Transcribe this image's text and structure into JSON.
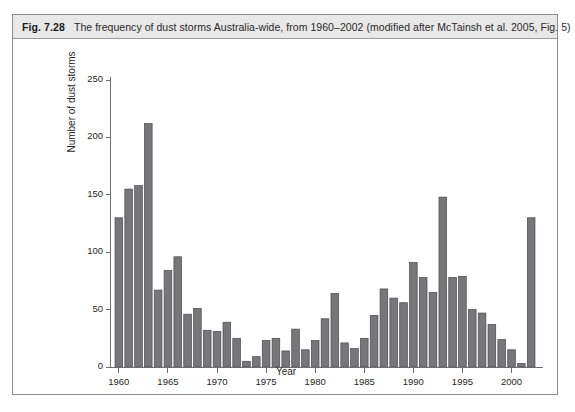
{
  "figure": {
    "number": "Fig. 7.28",
    "caption": "The frequency of dust storms Australia-wide, from 1960–2002 (modified after McTainsh et al. 2005, Fig. 5)"
  },
  "colors": {
    "bar_fill": "#77777a",
    "bar_stroke": "#4a4a4c",
    "axis": "#6e6e6e",
    "frame": "#8d8d8d",
    "caption_band": "#e8e8e8",
    "page_background": "#ffffff",
    "text": "#1f1f1f"
  },
  "chart_data": {
    "type": "bar",
    "title": "",
    "subtitle": "",
    "xlabel": "Year",
    "ylabel": "Number of dust storms",
    "xlim": [
      1959.2,
      2002.8
    ],
    "ylim": [
      0,
      250
    ],
    "yticks": [
      0,
      50,
      100,
      150,
      200,
      250
    ],
    "ytick_labels": [
      "0",
      "50",
      "100",
      "150",
      "200",
      "250"
    ],
    "xticks": [
      1960,
      1965,
      1970,
      1975,
      1980,
      1985,
      1990,
      1995,
      2000
    ],
    "xtick_labels": [
      "1960",
      "1965",
      "1970",
      "1975",
      "1980",
      "1985",
      "1990",
      "1995",
      "2000"
    ],
    "grid": false,
    "legend": false,
    "legend_position": "none",
    "categories": [
      1960,
      1961,
      1962,
      1963,
      1964,
      1965,
      1966,
      1967,
      1968,
      1969,
      1970,
      1971,
      1972,
      1973,
      1974,
      1975,
      1976,
      1977,
      1978,
      1979,
      1980,
      1981,
      1982,
      1983,
      1984,
      1985,
      1986,
      1987,
      1988,
      1989,
      1990,
      1991,
      1992,
      1993,
      1994,
      1995,
      1996,
      1997,
      1998,
      1999,
      2000,
      2001,
      2002
    ],
    "values": [
      130,
      155,
      158,
      212,
      67,
      84,
      96,
      46,
      51,
      32,
      31,
      39,
      25,
      5,
      9,
      23,
      25,
      14,
      33,
      15,
      23,
      42,
      64,
      21,
      16,
      25,
      45,
      68,
      60,
      56,
      91,
      78,
      65,
      148,
      78,
      79,
      50,
      47,
      37,
      24,
      15,
      3,
      130
    ]
  }
}
